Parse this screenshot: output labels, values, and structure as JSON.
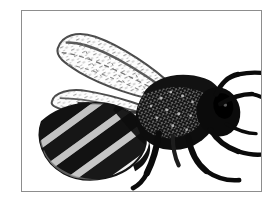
{
  "page": {
    "background_color": "#ffffff",
    "width": 278,
    "height": 208
  },
  "figure": {
    "name": "honey-bee-illustration",
    "caption": "",
    "alt_text": "Black and white engraved illustration of a honey bee in profile, facing right, with two outspread wings, a striped abdomen and six legs",
    "subject": "honey bee",
    "style": "black-and-white stippled engraving / line art",
    "orientation": "side profile facing right",
    "frame": {
      "border_color": "#8d8d8d",
      "border_width_px": 1,
      "fill_color": "#ffffff",
      "x": 21,
      "y": 10,
      "width": 241,
      "height": 182
    },
    "ink_color": "#0c0c0c",
    "mid_tone_color": "#6e6e6e",
    "light_tone_color": "#c9c9c9",
    "parts": [
      {
        "id": "forewing",
        "label": "Forewing",
        "tone": "light with dark outline and stipple venation"
      },
      {
        "id": "hindwing",
        "label": "Hindwing",
        "tone": "light with dark outline and stipple venation"
      },
      {
        "id": "abdomen",
        "label": "Abdomen",
        "tone": "banded, alternating dark and light diagonal stripes"
      },
      {
        "id": "thorax",
        "label": "Thorax",
        "tone": "dense black with fuzzy stippled hair"
      },
      {
        "id": "head",
        "label": "Head",
        "tone": "solid black"
      },
      {
        "id": "antenna",
        "label": "Antenna",
        "tone": "solid black, elbowed, pointing up and right"
      },
      {
        "id": "foreleg",
        "label": "Foreleg",
        "tone": "solid black"
      },
      {
        "id": "midleg",
        "label": "Middle leg",
        "tone": "solid black"
      },
      {
        "id": "hindleg",
        "label": "Hind leg",
        "tone": "solid black"
      }
    ]
  }
}
